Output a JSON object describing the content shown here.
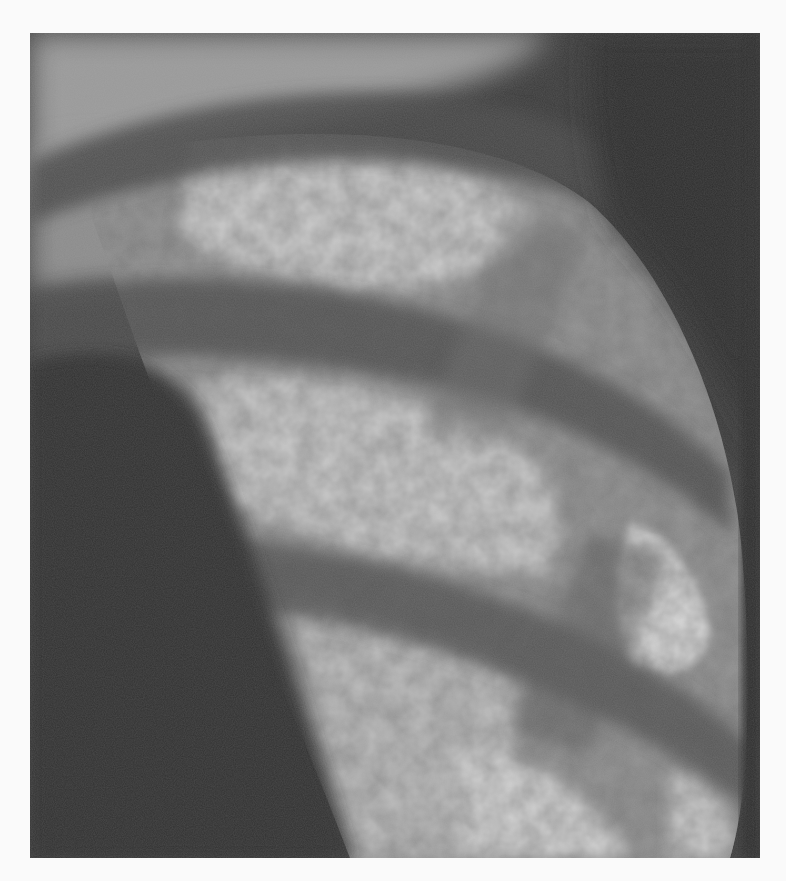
{
  "figure": {
    "type": "grayscale radiograph",
    "tones": {
      "page_background": "#fafafa",
      "dark_soft_tissue": "#3a3a3a",
      "mediastinum_shadow": "#333333",
      "rib_band": "#505050",
      "lung_field_mid": "#8a8a8a",
      "lung_field_bright": "#c8c8c8",
      "highlight": "#dcdcdc"
    },
    "bounds": {
      "x": 30,
      "y": 33,
      "width": 730,
      "height": 825
    }
  }
}
